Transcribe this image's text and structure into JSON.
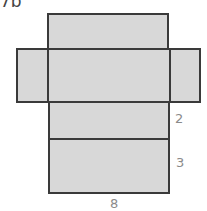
{
  "figure": {
    "problem_label": "7b",
    "colors": {
      "fill": "#d8d8d8",
      "stroke": "#3a3a3a",
      "dimension_text": "#8a8a8a"
    }
  },
  "dimensions": {
    "height": "2",
    "width": "3",
    "length": "8"
  }
}
